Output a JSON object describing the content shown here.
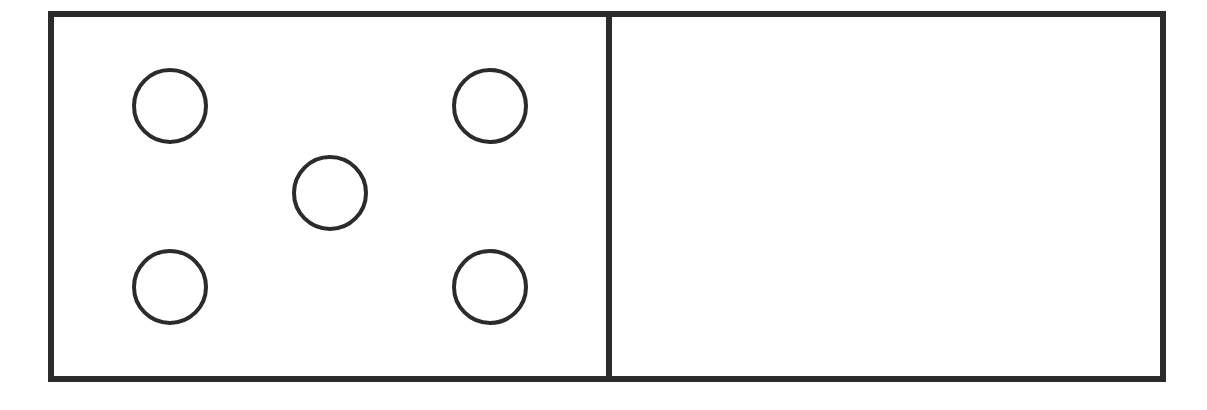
{
  "diagram": {
    "type": "domino",
    "stroke_color": "#2b2b2b",
    "background": "#ffffff",
    "halves": [
      {
        "name": "left",
        "pip_count": 5,
        "pips": [
          {
            "cx": 170,
            "cy": 106
          },
          {
            "cx": 490,
            "cy": 106
          },
          {
            "cx": 330,
            "cy": 193
          },
          {
            "cx": 170,
            "cy": 287
          },
          {
            "cx": 490,
            "cy": 287
          }
        ]
      },
      {
        "name": "right",
        "pip_count": 0,
        "pips": []
      }
    ]
  }
}
